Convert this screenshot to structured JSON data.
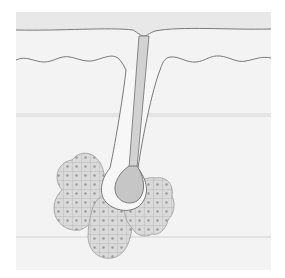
{
  "figure": {
    "colors": {
      "background": "#ffffff",
      "panel": "#f3f3f3",
      "epidermis": "#e6e6e6",
      "outline": "#7a7a7a",
      "hair_shaft": "#c9c9c9",
      "gland_fill": "#d9d9d9",
      "cell_line": "#a0a0a0",
      "nucleus": "#9a9a9a"
    }
  }
}
